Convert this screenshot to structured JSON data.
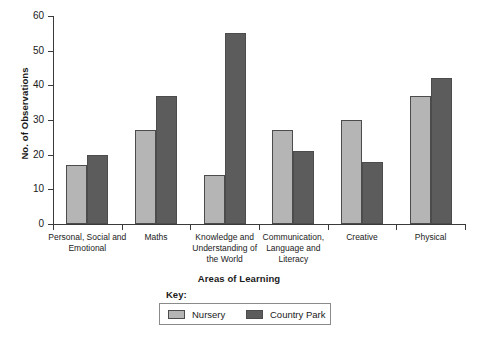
{
  "chart_data": {
    "type": "bar",
    "title": "",
    "xlabel": "Areas of Learning",
    "ylabel": "No. of Observations",
    "ylim": [
      0,
      60
    ],
    "ytick_step": 10,
    "yticks": [
      0,
      10,
      20,
      30,
      40,
      50,
      60
    ],
    "grid": false,
    "legend_position": "bottom-center",
    "legend_title": "Key:",
    "categories": [
      "Personal, Social and Emotional",
      "Maths",
      "Knowledge and Understanding of the World",
      "Communication, Language and Literacy",
      "Creative",
      "Physical"
    ],
    "category_lines": [
      [
        "Personal, Social and",
        "Emotional"
      ],
      [
        "Maths"
      ],
      [
        "Knowledge and",
        "Understanding of",
        "the World"
      ],
      [
        "Communication,",
        "Language and",
        "Literacy"
      ],
      [
        "Creative"
      ],
      [
        "Physical"
      ]
    ],
    "series": [
      {
        "name": "Nursery",
        "color": "#b5b5b5",
        "values": [
          17,
          27,
          14,
          27,
          30,
          37
        ]
      },
      {
        "name": "Country Park",
        "color": "#5c5c5c",
        "values": [
          20,
          37,
          55,
          21,
          18,
          42
        ]
      }
    ]
  },
  "axis": {
    "line_color": "#3a3a3a"
  }
}
